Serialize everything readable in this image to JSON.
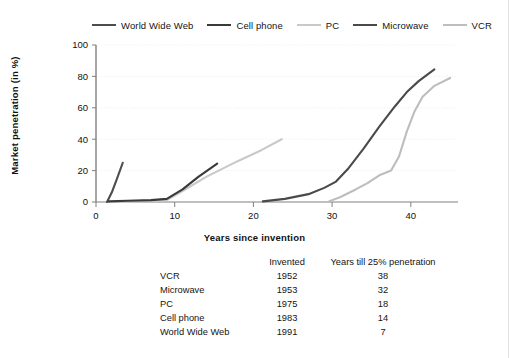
{
  "chart_data": {
    "type": "line",
    "title": "",
    "xlabel": "Years since invention",
    "ylabel": "Market penetration (in %)",
    "xlim": [
      0,
      46
    ],
    "ylim": [
      0,
      100
    ],
    "xticks": [
      0,
      10,
      20,
      30,
      40
    ],
    "yticks": [
      0,
      20,
      40,
      60,
      80,
      100
    ],
    "grid": true,
    "legend_position": "top",
    "series": [
      {
        "name": "World Wide Web",
        "color": "#4d4d4d",
        "points": [
          [
            1.4,
            0
          ],
          [
            2.0,
            6
          ],
          [
            2.6,
            14
          ],
          [
            3.4,
            25
          ]
        ]
      },
      {
        "name": "Cell phone",
        "color": "#3a3a3a",
        "points": [
          [
            1.6,
            0.4
          ],
          [
            4,
            0.8
          ],
          [
            7,
            1.2
          ],
          [
            9,
            2
          ],
          [
            11,
            8
          ],
          [
            13,
            16
          ],
          [
            15.4,
            24.5
          ]
        ]
      },
      {
        "name": "PC",
        "color": "#c9c9c9",
        "points": [
          [
            1.6,
            0
          ],
          [
            6,
            0.4
          ],
          [
            9,
            1.2
          ],
          [
            11,
            7
          ],
          [
            14,
            16
          ],
          [
            18,
            26
          ],
          [
            21,
            33
          ],
          [
            23.6,
            40
          ]
        ]
      },
      {
        "name": "Microwave",
        "color": "#4a4a4a",
        "points": [
          [
            21.2,
            0.4
          ],
          [
            24,
            2
          ],
          [
            27,
            5
          ],
          [
            29,
            9
          ],
          [
            30.5,
            13
          ],
          [
            32,
            21
          ],
          [
            34,
            34
          ],
          [
            36,
            48
          ],
          [
            38,
            61
          ],
          [
            39.5,
            70
          ],
          [
            41,
            77
          ],
          [
            43,
            84.5
          ]
        ]
      },
      {
        "name": "VCR",
        "color": "#bdbdbd",
        "points": [
          [
            29.6,
            0.4
          ],
          [
            31,
            3
          ],
          [
            33,
            8
          ],
          [
            34.5,
            12
          ],
          [
            36,
            17
          ],
          [
            37.5,
            20
          ],
          [
            38.5,
            29
          ],
          [
            39.5,
            45
          ],
          [
            40.5,
            58
          ],
          [
            41.5,
            67
          ],
          [
            43,
            74
          ],
          [
            45,
            79
          ]
        ]
      }
    ]
  },
  "table": {
    "headers": [
      "",
      "Invented",
      "Years till 25% penetration"
    ],
    "rows": [
      {
        "name": "VCR",
        "invented": "1952",
        "years": "38"
      },
      {
        "name": "Microwave",
        "invented": "1953",
        "years": "32"
      },
      {
        "name": "PC",
        "invented": "1975",
        "years": "18"
      },
      {
        "name": "Cell phone",
        "invented": "1983",
        "years": "14"
      },
      {
        "name": "World Wide Web",
        "invented": "1991",
        "years": "7"
      }
    ]
  },
  "colors": {
    "axis": "#808080",
    "grid": "#ededed",
    "text": "#141414",
    "border": "#e2e2e2"
  }
}
